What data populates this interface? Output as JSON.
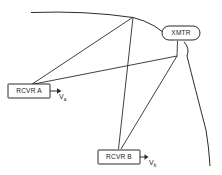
{
  "diagram": {
    "background_color": "#ffffff",
    "stroke_color": "#2b2b2b",
    "text_color": "#1a1a1a",
    "nodes": [
      {
        "id": "rcvr-a",
        "label": "RCVR A",
        "shape": "rectangle",
        "x": 8,
        "y": 84,
        "width": 42,
        "height": 14
      },
      {
        "id": "rcvr-b",
        "label": "RCVR B",
        "shape": "rectangle",
        "x": 98,
        "y": 150,
        "width": 42,
        "height": 14
      },
      {
        "id": "xmtr",
        "label": "XMTR",
        "shape": "stadium",
        "x": 162,
        "y": 26,
        "width": 38,
        "height": 14
      }
    ],
    "velocity_arrows": [
      {
        "id": "va",
        "symbol": "V",
        "subscript": "a",
        "from_node": "rcvr-a",
        "label_x": 59,
        "label_y": 97
      },
      {
        "id": "vb",
        "symbol": "V",
        "subscript": "b",
        "from_node": "rcvr-b",
        "label_x": 149,
        "label_y": 163
      }
    ],
    "vertices": {
      "top": {
        "x": 133,
        "y": 17
      },
      "right_junction": {
        "x": 177,
        "y": 56
      }
    },
    "arcs": [
      {
        "id": "upper-arc",
        "description": "curved arc sweeping from upper-left through top vertex past XMTR"
      },
      {
        "id": "right-arc",
        "description": "curved arc descending from right junction to lower right corner"
      }
    ],
    "links": [
      {
        "id": "rcvra-to-top",
        "from": "rcvr-a",
        "to": "top-vertex"
      },
      {
        "id": "rcvra-to-junction",
        "from": "rcvr-a",
        "to": "right-junction"
      },
      {
        "id": "top-to-rcvrb",
        "from": "top-vertex",
        "to": "rcvr-b"
      },
      {
        "id": "rcvrb-to-junction",
        "from": "rcvr-b",
        "to": "right-junction"
      },
      {
        "id": "xmtr-to-junction",
        "from": "xmtr",
        "to": "right-junction"
      },
      {
        "id": "top-to-xmtr-arc",
        "from": "top-vertex",
        "to": "xmtr"
      }
    ]
  }
}
